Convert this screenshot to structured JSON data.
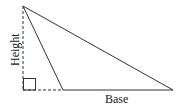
{
  "diagram": {
    "type": "triangle-area-diagram",
    "labels": {
      "height": "Height",
      "base": "Base"
    },
    "vertices": {
      "apex": [
        23,
        6
      ],
      "base_left": [
        63,
        90
      ],
      "base_right": [
        173,
        90
      ]
    },
    "height_foot": [
      23,
      90
    ],
    "right_angle_marker": true,
    "colors": {
      "stroke": "#333333",
      "background": "#ffffff"
    }
  }
}
